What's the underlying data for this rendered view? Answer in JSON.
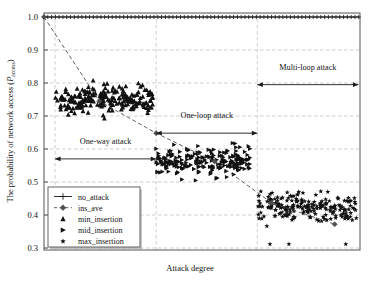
{
  "chart_data": {
    "type": "scatter",
    "title": "",
    "xlabel": "Attack degree",
    "ylabel": "The probability of network access (P_access)",
    "ylabel_main": "The probability of network access (",
    "ylabel_italic": "P",
    "ylabel_sub": "access",
    "ylabel_tail": ")",
    "xlim": [
      0,
      1
    ],
    "ylim": [
      0.3,
      1.0
    ],
    "yticks": [
      0.3,
      0.4,
      0.5,
      0.6,
      0.7,
      0.8,
      0.9,
      1.0
    ],
    "ytick_labels": [
      "0.3",
      "0.4",
      "0.5",
      "0.6",
      "0.7",
      "0.8",
      "0.9",
      "1.0"
    ],
    "xticks": [],
    "xtick_labels": [],
    "grid": true,
    "grid_style": "dashed",
    "legend_position": "lower-left",
    "series": [
      {
        "name": "no_attack",
        "marker": "plus",
        "linestyle": "solid",
        "color": "#1a1a1a",
        "description": "flat line of plus markers at constant 1.0 across full attack degree range",
        "constant_value": 1.0,
        "x": [
          0.0,
          0.012,
          0.024,
          0.036,
          0.048,
          0.06,
          0.072,
          0.084,
          0.096,
          0.108,
          0.12,
          0.132,
          0.144,
          0.156,
          0.168,
          0.18,
          0.192,
          0.204,
          0.216,
          0.228,
          0.24,
          0.252,
          0.264,
          0.276,
          0.288,
          0.3,
          0.312,
          0.324,
          0.336,
          0.348,
          0.36,
          0.372,
          0.384,
          0.396,
          0.408,
          0.42,
          0.432,
          0.444,
          0.456,
          0.468,
          0.48,
          0.492,
          0.504,
          0.516,
          0.528,
          0.54,
          0.552,
          0.564,
          0.576,
          0.588,
          0.6,
          0.612,
          0.624,
          0.636,
          0.648,
          0.66,
          0.672,
          0.684,
          0.696,
          0.708,
          0.72,
          0.732,
          0.744,
          0.756,
          0.768,
          0.78,
          0.792,
          0.804,
          0.816,
          0.828,
          0.84,
          0.852,
          0.864,
          0.876,
          0.888,
          0.9,
          0.912,
          0.924,
          0.936,
          0.948,
          0.96,
          0.972,
          0.984,
          0.996
        ],
        "y": [
          1.0,
          1.0,
          1.0,
          1.0,
          1.0,
          1.0,
          1.0,
          1.0,
          1.0,
          1.0,
          1.0,
          1.0,
          1.0,
          1.0,
          1.0,
          1.0,
          1.0,
          1.0,
          1.0,
          1.0,
          1.0,
          1.0,
          1.0,
          1.0,
          1.0,
          1.0,
          1.0,
          1.0,
          1.0,
          1.0,
          1.0,
          1.0,
          1.0,
          1.0,
          1.0,
          1.0,
          1.0,
          1.0,
          1.0,
          1.0,
          1.0,
          1.0,
          1.0,
          1.0,
          1.0,
          1.0,
          1.0,
          1.0,
          1.0,
          1.0,
          1.0,
          1.0,
          1.0,
          1.0,
          1.0,
          1.0,
          1.0,
          1.0,
          1.0,
          1.0,
          1.0,
          1.0,
          1.0,
          1.0,
          1.0,
          1.0,
          1.0,
          1.0,
          1.0,
          1.0,
          1.0,
          1.0,
          1.0,
          1.0,
          1.0,
          1.0,
          1.0,
          1.0,
          1.0,
          1.0,
          1.0,
          1.0,
          1.0,
          1.0
        ]
      },
      {
        "name": "ins_ave",
        "marker": "diamond",
        "linestyle": "dashed",
        "color": "#4d4d4d",
        "description": "descending dashed average line with diamond waypoints from 1.0 down to about 0.37",
        "x": [
          0.0,
          0.175,
          0.355,
          0.54,
          0.72,
          0.92
        ],
        "y": [
          1.0,
          0.745,
          0.648,
          0.562,
          0.437,
          0.372
        ]
      },
      {
        "name": "min_insertion",
        "marker": "triangle-up",
        "linestyle": "none",
        "color": "#111111",
        "description": "dense scatter cloud in the one-way attack region, roughly 0.67 to 0.82",
        "x_range": [
          0.035,
          0.345
        ],
        "y_range": [
          0.67,
          0.82
        ],
        "y_center": 0.752,
        "count": 210
      },
      {
        "name": "mid_insertion",
        "marker": "triangle-right",
        "linestyle": "none",
        "color": "#111111",
        "description": "scatter cloud in the one-loop attack region, roughly 0.48 to 0.63",
        "x_range": [
          0.355,
          0.655
        ],
        "y_range": [
          0.48,
          0.63
        ],
        "y_center": 0.562,
        "count": 215
      },
      {
        "name": "max_insertion",
        "marker": "star",
        "linestyle": "none",
        "color": "#111111",
        "description": "scatter cloud in the multi-loop attack region, roughly 0.355 to 0.51 with low outliers near 0.31",
        "x_range": [
          0.675,
          0.99
        ],
        "y_range": [
          0.355,
          0.51
        ],
        "y_center": 0.425,
        "count": 205,
        "outliers_y": [
          0.312,
          0.312,
          0.312
        ]
      }
    ],
    "annotations": [
      {
        "label": "One-way attack",
        "arrow": "double-headed",
        "x_start": 0.035,
        "x_end": 0.355,
        "y": 0.57,
        "label_y": 0.615
      },
      {
        "label": "One-loop attack",
        "arrow": "double-headed",
        "x_start": 0.355,
        "x_end": 0.675,
        "y": 0.648,
        "label_y": 0.693
      },
      {
        "label": "Multi-loop attack",
        "arrow": "double-headed",
        "x_start": 0.675,
        "x_end": 0.995,
        "y": 0.795,
        "label_y": 0.84
      }
    ],
    "legend_entries": [
      {
        "label": "no_attack",
        "marker": "plus",
        "line": "solid"
      },
      {
        "label": "ins_ave",
        "marker": "diamond",
        "line": "dashed"
      },
      {
        "label": "min_insertion",
        "marker": "triangle-up",
        "line": "none"
      },
      {
        "label": "mid_insertion",
        "marker": "triangle-right",
        "line": "none"
      },
      {
        "label": "max_insertion",
        "marker": "star",
        "line": "none"
      }
    ],
    "colors": {
      "axis": "#555555",
      "grid": "#b9b9c4",
      "marker": "#111111",
      "average_line": "#4d4d4d",
      "background": "#ffffff"
    }
  }
}
